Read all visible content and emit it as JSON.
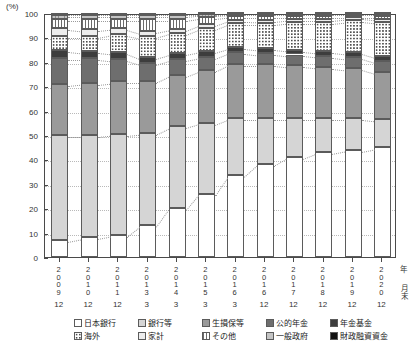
{
  "axis": {
    "unit_label": "(%)",
    "y_ticks": [
      0,
      10,
      20,
      30,
      40,
      50,
      60,
      70,
      80,
      90,
      100
    ],
    "x_year_caption": "年",
    "x_month_caption": "月末"
  },
  "legend": [
    {
      "key": "boj",
      "label": "日本銀行",
      "swatch": "s-boj"
    },
    {
      "key": "bank",
      "label": "銀行等",
      "swatch": "s-bank"
    },
    {
      "key": "ins",
      "label": "生損保等",
      "swatch": "s-ins"
    },
    {
      "key": "pub",
      "label": "公的年金",
      "swatch": "s-pub"
    },
    {
      "key": "pf",
      "label": "年金基金",
      "swatch": "s-pf"
    },
    {
      "key": "ovs",
      "label": "海外",
      "swatch": "s-ovs"
    },
    {
      "key": "hh",
      "label": "家計",
      "swatch": "s-hh"
    },
    {
      "key": "oth",
      "label": "その他",
      "swatch": "s-oth"
    },
    {
      "key": "gov",
      "label": "一般政府",
      "swatch": "s-gov"
    },
    {
      "key": "fil",
      "label": "財政融資資金",
      "swatch": "s-fil"
    }
  ],
  "chart_data": {
    "type": "bar",
    "title": "",
    "xlabel": "年月末",
    "ylabel": "(%)",
    "ylim": [
      0,
      100
    ],
    "grid": true,
    "stacked": true,
    "legend_position": "bottom",
    "categories": [
      "2009/12",
      "2010/12",
      "2011/12",
      "2013/3",
      "2014/3",
      "2015/3",
      "2016/3",
      "2016/12",
      "2017/12",
      "2018/12",
      "2019/12",
      "2020/12"
    ],
    "category_years": [
      "2009",
      "2010",
      "2011",
      "2013",
      "2014",
      "2015",
      "2016",
      "2016",
      "2017",
      "2018",
      "2019",
      "2020"
    ],
    "category_months": [
      "12",
      "12",
      "12",
      "3",
      "3",
      "3",
      "3",
      "12",
      "12",
      "12",
      "12",
      "12"
    ],
    "series": [
      {
        "name": "日本銀行",
        "key": "boj",
        "values": [
          7.0,
          8.0,
          9.0,
          13.0,
          20.0,
          26.0,
          33.5,
          38.0,
          41.0,
          43.0,
          44.0,
          45.0
        ]
      },
      {
        "name": "銀行等",
        "key": "bank",
        "values": [
          43.0,
          42.0,
          41.5,
          38.0,
          33.5,
          29.0,
          23.5,
          19.0,
          16.0,
          14.0,
          13.0,
          11.5
        ]
      },
      {
        "name": "生損保等",
        "key": "ins",
        "values": [
          21.0,
          21.5,
          21.5,
          21.0,
          21.0,
          21.5,
          22.0,
          22.0,
          21.5,
          21.0,
          20.5,
          19.5
        ]
      },
      {
        "name": "公的年金",
        "key": "pub",
        "values": [
          10.5,
          10.0,
          9.0,
          7.5,
          6.5,
          5.5,
          5.0,
          4.5,
          4.5,
          4.5,
          4.5,
          4.5
        ]
      },
      {
        "name": "年金基金",
        "key": "pf",
        "values": [
          3.5,
          3.0,
          3.0,
          2.5,
          2.5,
          2.5,
          2.0,
          2.0,
          2.0,
          2.0,
          2.0,
          2.0
        ]
      },
      {
        "name": "海外",
        "key": "ovs",
        "values": [
          5.5,
          6.0,
          7.5,
          8.5,
          8.5,
          9.5,
          10.0,
          10.5,
          11.5,
          12.0,
          13.0,
          14.0
        ]
      },
      {
        "name": "家計",
        "key": "hh",
        "values": [
          3.5,
          3.0,
          2.5,
          2.0,
          1.5,
          1.5,
          1.3,
          1.2,
          1.2,
          1.2,
          1.2,
          1.2
        ]
      },
      {
        "name": "その他",
        "key": "oth",
        "values": [
          3.5,
          4.0,
          3.5,
          5.0,
          4.0,
          2.8,
          1.5,
          1.6,
          1.1,
          1.1,
          0.6,
          1.1
        ]
      },
      {
        "name": "一般政府",
        "key": "gov",
        "values": [
          1.5,
          1.5,
          1.5,
          1.5,
          1.5,
          1.2,
          1.0,
          1.0,
          1.0,
          1.0,
          1.0,
          1.0
        ]
      },
      {
        "name": "財政融資資金",
        "key": "fil",
        "values": [
          1.0,
          1.0,
          1.0,
          1.0,
          1.0,
          0.5,
          0.2,
          0.2,
          0.2,
          0.2,
          0.2,
          0.2
        ]
      }
    ]
  }
}
